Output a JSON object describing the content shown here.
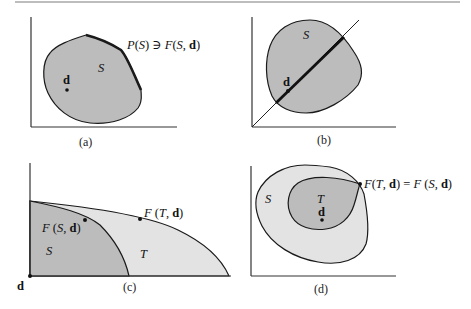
{
  "figure": {
    "colors": {
      "dark_fill": "#bcbcbc",
      "light_fill": "#e3e3e3",
      "stroke": "#1a1a1a",
      "axis": "#333333",
      "background": "#ffffff"
    },
    "panels": [
      {
        "id": "a",
        "caption": "(a)",
        "set_label": "S",
        "point_label": "d",
        "annotation": {
          "prefix": "P",
          "open1": "(",
          "arg1": "S",
          "close1": ")",
          "relation": " ∋ ",
          "func": "F",
          "open2": "(",
          "arg2": "S",
          "comma": ", ",
          "arg3": "d",
          "close2": ")"
        }
      },
      {
        "id": "b",
        "caption": "(b)",
        "set_label": "S",
        "point_label": "d"
      },
      {
        "id": "c",
        "caption": "(c)",
        "inner_set_label": "S",
        "outer_set_label": "T",
        "origin_label": "d",
        "label_fs": {
          "func": "F",
          "open": " (",
          "arg1": "S",
          "comma": ", ",
          "arg2": "d",
          "close": ")"
        },
        "label_ft": {
          "func": "F",
          "open": " (",
          "arg1": "T",
          "comma": ", ",
          "arg2": "d",
          "close": ")"
        }
      },
      {
        "id": "d",
        "caption": "(d)",
        "outer_set_label": "S",
        "inner_set_label": "T",
        "point_label": "d",
        "annotation": {
          "func1": "F",
          "open1": "(",
          "arg1": "T",
          "comma1": ", ",
          "arg2": "d",
          "close1": ")",
          "eq": " = ",
          "func2": "F",
          "open2": " (",
          "arg3": "S",
          "comma2": ", ",
          "arg4": "d",
          "close2": ")"
        }
      }
    ]
  }
}
